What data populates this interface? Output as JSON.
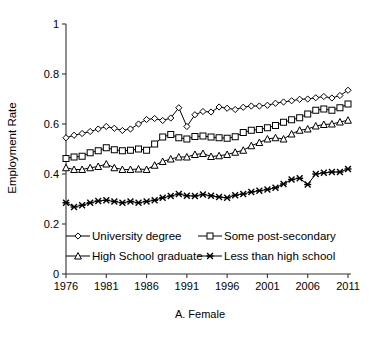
{
  "chart_data": {
    "type": "line",
    "title": "",
    "subtitle": "",
    "caption": "A. Female",
    "xlabel": "",
    "ylabel": "Employment Rate",
    "xlim": [
      1976,
      2011
    ],
    "ylim": [
      0,
      1
    ],
    "xticks": [
      1976,
      1981,
      1986,
      1991,
      1996,
      2001,
      2006,
      2011
    ],
    "xtick_labels": [
      "1976",
      "1981",
      "1986",
      "1991",
      "1996",
      "2001",
      "2006",
      "2011"
    ],
    "yticks": [
      0,
      0.2,
      0.4,
      0.6,
      0.8,
      1
    ],
    "ytick_labels": [
      "0",
      "0.2",
      "0.4",
      "0.6",
      "0.8",
      "1"
    ],
    "grid": false,
    "legend_position": "inside-bottom",
    "x": [
      1976,
      1977,
      1978,
      1979,
      1980,
      1981,
      1982,
      1983,
      1984,
      1985,
      1986,
      1987,
      1988,
      1989,
      1990,
      1991,
      1992,
      1993,
      1994,
      1995,
      1996,
      1997,
      1998,
      1999,
      2000,
      2001,
      2002,
      2003,
      2004,
      2005,
      2006,
      2007,
      2008,
      2009,
      2010,
      2011
    ],
    "series": [
      {
        "name": "University degree",
        "marker": "diamond",
        "values": [
          0.545,
          0.555,
          0.562,
          0.57,
          0.58,
          0.59,
          0.583,
          0.574,
          0.58,
          0.6,
          0.618,
          0.622,
          0.614,
          0.624,
          0.665,
          0.59,
          0.637,
          0.65,
          0.648,
          0.668,
          0.663,
          0.658,
          0.667,
          0.672,
          0.672,
          0.675,
          0.683,
          0.688,
          0.693,
          0.699,
          0.7,
          0.705,
          0.71,
          0.704,
          0.714,
          0.735
        ]
      },
      {
        "name": "Some post-secondary",
        "marker": "square",
        "values": [
          0.462,
          0.468,
          0.471,
          0.485,
          0.493,
          0.505,
          0.497,
          0.493,
          0.495,
          0.5,
          0.495,
          0.52,
          0.548,
          0.558,
          0.545,
          0.54,
          0.55,
          0.552,
          0.548,
          0.545,
          0.543,
          0.549,
          0.566,
          0.575,
          0.578,
          0.585,
          0.594,
          0.607,
          0.617,
          0.625,
          0.64,
          0.655,
          0.66,
          0.655,
          0.665,
          0.68
        ]
      },
      {
        "name": "High School graduate",
        "marker": "triangle",
        "values": [
          0.425,
          0.418,
          0.418,
          0.425,
          0.43,
          0.44,
          0.425,
          0.418,
          0.418,
          0.42,
          0.418,
          0.435,
          0.45,
          0.46,
          0.468,
          0.468,
          0.478,
          0.482,
          0.47,
          0.473,
          0.478,
          0.487,
          0.495,
          0.513,
          0.526,
          0.54,
          0.545,
          0.54,
          0.56,
          0.575,
          0.58,
          0.592,
          0.598,
          0.6,
          0.608,
          0.615
        ]
      },
      {
        "name": "Less than high school",
        "marker": "x",
        "values": [
          0.285,
          0.268,
          0.275,
          0.285,
          0.292,
          0.295,
          0.29,
          0.285,
          0.29,
          0.285,
          0.29,
          0.295,
          0.305,
          0.312,
          0.32,
          0.313,
          0.312,
          0.318,
          0.313,
          0.308,
          0.305,
          0.315,
          0.32,
          0.328,
          0.333,
          0.338,
          0.345,
          0.36,
          0.378,
          0.383,
          0.358,
          0.4,
          0.405,
          0.408,
          0.408,
          0.42
        ]
      }
    ]
  },
  "legend": {
    "items": [
      {
        "label": "University degree",
        "marker": "diamond"
      },
      {
        "label": "Some post-secondary",
        "marker": "square"
      },
      {
        "label": "High School graduate",
        "marker": "triangle"
      },
      {
        "label": "Less than high school",
        "marker": "x"
      }
    ]
  },
  "colors": {
    "axis": "#333333",
    "series_stroke": "#000000",
    "marker_fill": "#ffffff",
    "background": "#ffffff"
  }
}
